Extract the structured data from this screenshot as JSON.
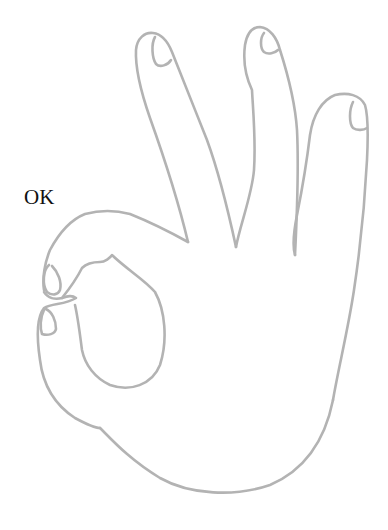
{
  "figure": {
    "label": "OK",
    "stroke_color": "#b3b3b3",
    "label_color": "#111111",
    "background": "#ffffff"
  }
}
